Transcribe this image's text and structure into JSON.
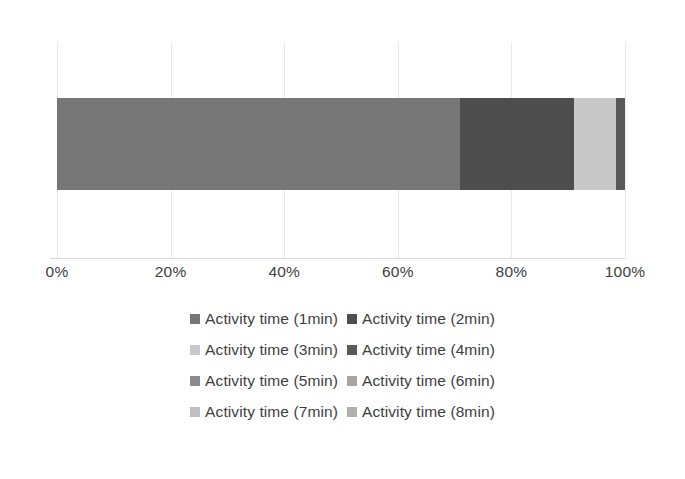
{
  "chart_data": {
    "type": "bar",
    "orientation": "horizontal",
    "stacked": true,
    "normalized": true,
    "title": "",
    "subtitle": "",
    "xlabel": "",
    "ylabel": "",
    "categories": [
      ""
    ],
    "xlim": [
      0,
      100
    ],
    "xticks": [
      0,
      20,
      40,
      60,
      80,
      100
    ],
    "xtick_labels": [
      "0%",
      "20%",
      "40%",
      "60%",
      "80%",
      "100%"
    ],
    "grid": true,
    "grid_axis": "x",
    "legend_position": "bottom",
    "legend_columns": 2,
    "series": [
      {
        "name": "Activity time (1min)",
        "values": [
          71.0
        ],
        "color": "#767676"
      },
      {
        "name": "Activity time (2min)",
        "values": [
          20.0
        ],
        "color": "#4d4d4d"
      },
      {
        "name": "Activity time (3min)",
        "values": [
          7.5
        ],
        "color": "#c8c8c8"
      },
      {
        "name": "Activity time (4min)",
        "values": [
          1.5
        ],
        "color": "#595959"
      },
      {
        "name": "Activity time (5min)",
        "values": [
          0.0
        ],
        "color": "#8c8c8c"
      },
      {
        "name": "Activity time (6min)",
        "values": [
          0.0
        ],
        "color": "#a6a6a6"
      },
      {
        "name": "Activity time (7min)",
        "values": [
          0.0
        ],
        "color": "#bfbfbf"
      },
      {
        "name": "Activity time (8min)",
        "values": [
          0.0
        ],
        "color": "#b0b0b0"
      }
    ]
  },
  "axis": {
    "ticks": [
      {
        "label": "0%",
        "pos": 0
      },
      {
        "label": "20%",
        "pos": 20
      },
      {
        "label": "40%",
        "pos": 40
      },
      {
        "label": "60%",
        "pos": 60
      },
      {
        "label": "80%",
        "pos": 80
      },
      {
        "label": "100%",
        "pos": 100
      }
    ]
  },
  "legend": {
    "rows": [
      [
        {
          "label": "Activity time (1min)",
          "color": "#767676"
        },
        {
          "label": "Activity time (2min)",
          "color": "#4d4d4d"
        }
      ],
      [
        {
          "label": "Activity time (3min)",
          "color": "#c8c8c8"
        },
        {
          "label": "Activity time (4min)",
          "color": "#595959"
        }
      ],
      [
        {
          "label": "Activity time (5min)",
          "color": "#8c8c8c"
        },
        {
          "label": "Activity time (6min)",
          "color": "#a6a6a6"
        }
      ],
      [
        {
          "label": "Activity time (7min)",
          "color": "#bfbfbf"
        },
        {
          "label": "Activity time (8min)",
          "color": "#b0b0b0"
        }
      ]
    ]
  },
  "style": {
    "background": "#ffffff",
    "gridline_color": "#e9e9e9",
    "axis_line_color": "#d9d9d9",
    "text_color": "#404040"
  }
}
